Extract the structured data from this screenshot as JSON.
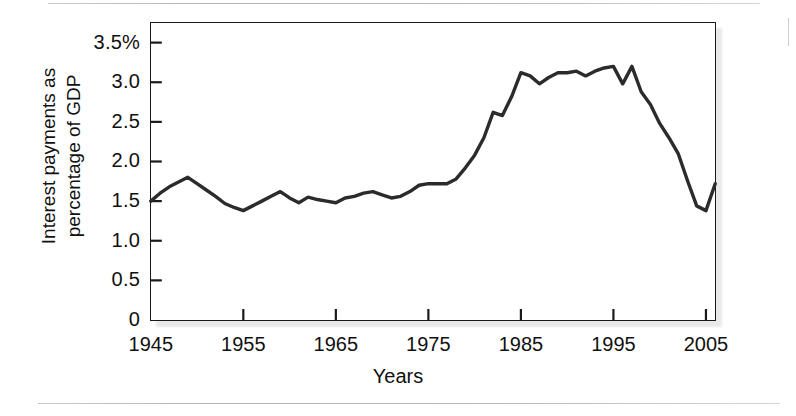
{
  "figure": {
    "background_color": "#ffffff",
    "line_color": "#2b2b2b",
    "axis_color": "#1a1a1a",
    "rule_color": "#c0c0c0"
  },
  "axis_titles": {
    "y_line1": "Interest payments as",
    "y_line2": "percentage of GDP",
    "x": "Years"
  },
  "ticks": {
    "y_labels": [
      "3.5%",
      "3.0",
      "2.5",
      "2.0",
      "1.5",
      "1.0",
      "0.5",
      "0"
    ],
    "y_values": [
      3.5,
      3.0,
      2.5,
      2.0,
      1.5,
      1.0,
      0.5,
      0
    ],
    "x_labels": [
      "1945",
      "1955",
      "1965",
      "1975",
      "1985",
      "1995",
      "2005"
    ],
    "x_values": [
      1945,
      1955,
      1965,
      1975,
      1985,
      1995,
      2005
    ]
  },
  "chart_data": {
    "type": "line",
    "title": "",
    "xlabel": "Years",
    "ylabel": "Interest payments as percentage of GDP",
    "xlim": [
      1945,
      2006
    ],
    "ylim": [
      0,
      3.75
    ],
    "grid": false,
    "legend": "none",
    "x": [
      1945,
      1946,
      1947,
      1948,
      1949,
      1950,
      1951,
      1952,
      1953,
      1954,
      1955,
      1956,
      1957,
      1958,
      1959,
      1960,
      1961,
      1962,
      1963,
      1964,
      1965,
      1966,
      1967,
      1968,
      1969,
      1970,
      1971,
      1972,
      1973,
      1974,
      1975,
      1976,
      1977,
      1978,
      1979,
      1980,
      1981,
      1982,
      1983,
      1984,
      1985,
      1986,
      1987,
      1988,
      1989,
      1990,
      1991,
      1992,
      1993,
      1994,
      1995,
      1996,
      1997,
      1998,
      1999,
      2000,
      2001,
      2002,
      2003,
      2004,
      2005,
      2006
    ],
    "y": [
      1.5,
      1.6,
      1.68,
      1.74,
      1.8,
      1.72,
      1.64,
      1.56,
      1.47,
      1.42,
      1.38,
      1.44,
      1.5,
      1.56,
      1.62,
      1.54,
      1.48,
      1.55,
      1.52,
      1.5,
      1.48,
      1.54,
      1.56,
      1.6,
      1.62,
      1.58,
      1.54,
      1.56,
      1.62,
      1.7,
      1.72,
      1.72,
      1.72,
      1.78,
      1.92,
      2.08,
      2.3,
      2.62,
      2.58,
      2.82,
      3.12,
      3.08,
      2.98,
      3.06,
      3.12,
      3.12,
      3.14,
      3.08,
      3.14,
      3.18,
      3.2,
      2.98,
      3.2,
      2.88,
      2.72,
      2.48,
      2.3,
      2.1,
      1.76,
      1.44,
      1.38,
      1.72
    ],
    "series": [
      {
        "name": "Interest payments as percentage of GDP",
        "color": "#2b2b2b",
        "line_width": 3.4
      }
    ]
  }
}
